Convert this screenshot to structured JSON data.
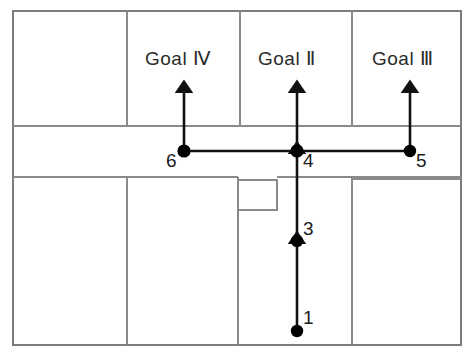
{
  "diagram": {
    "colors": {
      "wall": "#8a8a8a",
      "outer_wall": "#7d7d7d",
      "path": "#111111",
      "node": "#000000",
      "background": "#ffffff",
      "text": "#2b2b2b"
    },
    "goals": [
      {
        "id": "goal-4",
        "label": "Goal Ⅳ",
        "x": 192,
        "y": 62
      },
      {
        "id": "goal-2",
        "label": "Goal Ⅱ",
        "x": 296,
        "y": 62
      },
      {
        "id": "goal-3",
        "label": "Goal Ⅲ",
        "x": 409,
        "y": 62
      }
    ],
    "nodes": [
      {
        "id": "node-1",
        "label": "1",
        "x": 297,
        "y": 331,
        "label_x": 307,
        "label_y": 310
      },
      {
        "id": "node-3",
        "label": "3",
        "x": 297,
        "y": 241,
        "label_x": 307,
        "label_y": 220
      },
      {
        "id": "node-4",
        "label": "4",
        "x": 297,
        "y": 151,
        "label_x": 303,
        "label_y": 153
      },
      {
        "id": "node-5",
        "label": "5",
        "x": 410,
        "y": 151,
        "label_x": 416,
        "label_y": 153
      },
      {
        "id": "node-6",
        "label": "6",
        "x": 184,
        "y": 151,
        "label_x": 165,
        "label_y": 153
      }
    ],
    "path_segments": [
      {
        "id": "seg-1-to-3",
        "from": "node-1",
        "to": "node-3",
        "arrow": true
      },
      {
        "id": "seg-3-to-4",
        "from": "node-3",
        "to": "node-4",
        "arrow": true
      },
      {
        "id": "seg-6-to-4",
        "from": "node-6",
        "to": "node-4",
        "arrow": false
      },
      {
        "id": "seg-4-to-5",
        "from": "node-4",
        "to": "node-5",
        "arrow": false
      },
      {
        "id": "seg-6-to-goal-4",
        "from": "node-6",
        "to": "goal-4",
        "arrow": true
      },
      {
        "id": "seg-4-to-goal-2",
        "from": "node-4",
        "to": "goal-2",
        "arrow": true
      },
      {
        "id": "seg-5-to-goal-3",
        "from": "node-5",
        "to": "goal-3",
        "arrow": true
      }
    ]
  }
}
